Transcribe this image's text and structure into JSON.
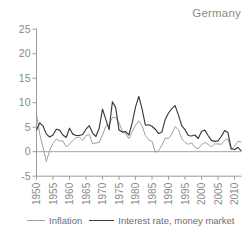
{
  "panel": {
    "title": "Germany"
  },
  "colors": {
    "background": "#ffffff",
    "axis": "#9b9b9b",
    "text": "#8a8a8a",
    "zero_line": "#9b9b9b",
    "inflation_line": "#a0a0a0",
    "interest_line": "#3a3a3a"
  },
  "legend": {
    "items": [
      {
        "label": "Inflation"
      },
      {
        "label": "Interest rate, money market"
      }
    ]
  },
  "chart_data": {
    "type": "line",
    "title": "Germany",
    "xlabel": "",
    "ylabel": "",
    "xlim": [
      1950,
      2012
    ],
    "ylim": [
      -5,
      25
    ],
    "grid": false,
    "zero_line": true,
    "legend_position": "bottom",
    "y_ticks": [
      25,
      20,
      15,
      10,
      5,
      0,
      -5
    ],
    "x_ticks": [
      1950,
      1955,
      1960,
      1965,
      1970,
      1975,
      1980,
      1985,
      1990,
      1995,
      2000,
      2005,
      2010
    ],
    "x_tick_labels": [
      "1950",
      "1955",
      "1960",
      "1965",
      "1970",
      "1975",
      "1980",
      "1985",
      "1990",
      "1995",
      "2000",
      "2005",
      "2010"
    ],
    "x": [
      1950,
      1951,
      1952,
      1953,
      1954,
      1955,
      1956,
      1957,
      1958,
      1959,
      1960,
      1961,
      1962,
      1963,
      1964,
      1965,
      1966,
      1967,
      1968,
      1969,
      1970,
      1971,
      1972,
      1973,
      1974,
      1975,
      1976,
      1977,
      1978,
      1979,
      1980,
      1981,
      1982,
      1983,
      1984,
      1985,
      1986,
      1987,
      1988,
      1989,
      1990,
      1991,
      1992,
      1993,
      1994,
      1995,
      1996,
      1997,
      1998,
      1999,
      2000,
      2001,
      2002,
      2003,
      2004,
      2005,
      2006,
      2007,
      2008,
      2009,
      2010,
      2011,
      2012
    ],
    "series": [
      {
        "name": "Inflation",
        "color": "#a0a0a0",
        "values": [
          7.7,
          3.5,
          0.8,
          -2.0,
          0.3,
          1.7,
          2.6,
          2.2,
          2.2,
          1.0,
          1.5,
          2.3,
          2.9,
          3.0,
          2.3,
          3.3,
          3.5,
          1.6,
          1.8,
          1.9,
          3.4,
          5.2,
          5.5,
          7.0,
          7.0,
          5.9,
          4.2,
          3.7,
          2.7,
          4.1,
          5.4,
          6.3,
          5.3,
          3.3,
          2.4,
          2.1,
          -0.1,
          0.2,
          1.3,
          2.8,
          2.7,
          3.6,
          5.1,
          4.5,
          2.7,
          1.9,
          1.5,
          1.8,
          0.9,
          0.6,
          1.4,
          1.9,
          1.5,
          1.0,
          1.6,
          1.6,
          1.5,
          2.3,
          2.6,
          0.3,
          1.1,
          2.1,
          2.0
        ]
      },
      {
        "name": "Interest rate, money market",
        "color": "#3a3a3a",
        "values": [
          4.4,
          5.9,
          5.2,
          3.6,
          3.0,
          3.4,
          4.6,
          4.4,
          3.4,
          2.9,
          4.8,
          3.6,
          3.3,
          3.3,
          3.5,
          4.6,
          5.3,
          3.8,
          3.1,
          4.8,
          8.7,
          6.6,
          4.5,
          10.2,
          9.0,
          4.4,
          4.0,
          4.1,
          3.4,
          5.9,
          9.1,
          11.3,
          8.7,
          5.4,
          5.5,
          5.2,
          4.6,
          3.7,
          4.0,
          6.6,
          7.9,
          8.8,
          9.4,
          7.5,
          5.3,
          4.5,
          3.3,
          3.2,
          3.4,
          2.7,
          4.1,
          4.4,
          3.3,
          2.3,
          2.1,
          2.2,
          3.1,
          4.3,
          3.9,
          0.7,
          0.4,
          0.9,
          0.2
        ]
      }
    ]
  }
}
